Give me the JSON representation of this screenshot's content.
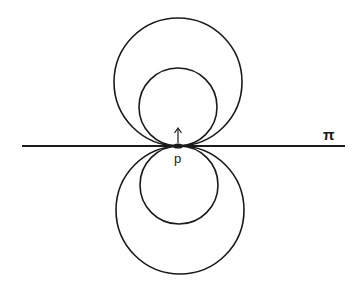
{
  "diagram": {
    "plane_label": "π",
    "point_label": "p",
    "stroke_color": "#1a1a1a",
    "background": "#ffffff",
    "line": {
      "x1": 22,
      "y1": 146,
      "x2": 345,
      "y2": 146
    },
    "circles": [
      {
        "name": "upper-large-circle",
        "cx": 178,
        "cy": 82,
        "r": 64
      },
      {
        "name": "upper-small-circle",
        "cx": 178,
        "cy": 107,
        "r": 39
      },
      {
        "name": "lower-small-circle",
        "cx": 179,
        "cy": 185,
        "r": 39
      },
      {
        "name": "lower-large-circle",
        "cx": 180,
        "cy": 210,
        "r": 64
      }
    ],
    "point": {
      "x": 178,
      "y": 146
    },
    "normal_arrow": {
      "x": 178,
      "y_from": 143,
      "y_to": 128
    }
  }
}
